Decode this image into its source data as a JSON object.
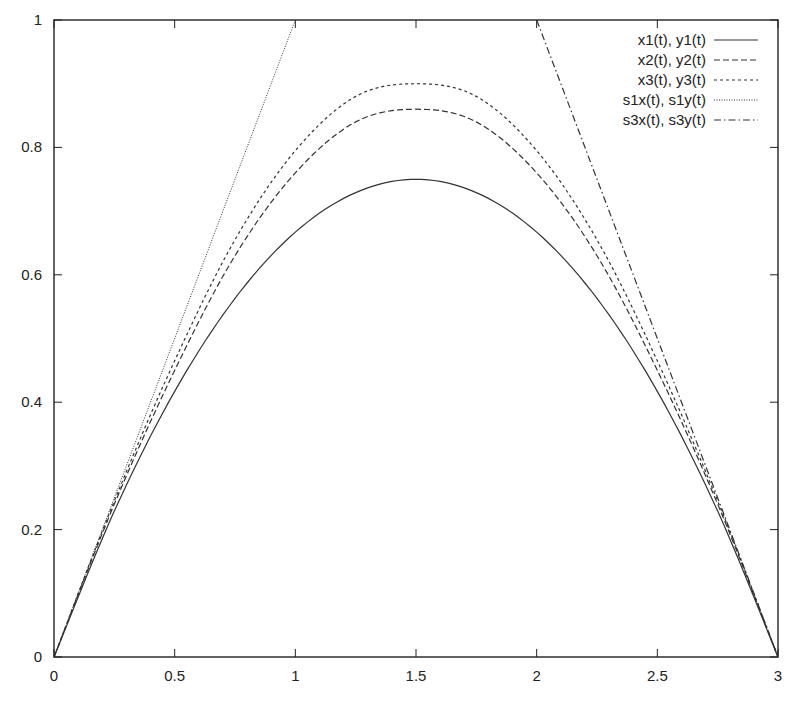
{
  "chart_data": {
    "type": "line",
    "title": "",
    "xlabel": "",
    "ylabel": "",
    "xlim": [
      0,
      3
    ],
    "ylim": [
      0,
      1
    ],
    "grid": false,
    "legend_position": "top-right (inside)",
    "x_ticks": [
      0,
      0.5,
      1,
      1.5,
      2,
      2.5,
      3
    ],
    "x_tick_labels": [
      "0",
      "0.5",
      "1",
      "1.5",
      "2",
      "2.5",
      "3"
    ],
    "y_ticks": [
      0,
      0.2,
      0.4,
      0.6,
      0.8,
      1
    ],
    "y_tick_labels": [
      "0",
      "0.2",
      "0.4",
      "0.6",
      "0.8",
      "1"
    ],
    "series": [
      {
        "name": "x1(t), y1(t)",
        "style": "solid",
        "shape": "parabola-like arch from (0,0) to (3,0)",
        "peak": {
          "x": 1.5,
          "y": 0.75
        },
        "x": [
          0,
          0.25,
          0.5,
          0.75,
          1,
          1.25,
          1.5,
          1.75,
          2,
          2.25,
          2.5,
          2.75,
          3
        ],
        "values": [
          0,
          0.229,
          0.417,
          0.563,
          0.667,
          0.729,
          0.75,
          0.729,
          0.667,
          0.563,
          0.417,
          0.229,
          0
        ]
      },
      {
        "name": "x2(t), y2(t)",
        "style": "dashed",
        "shape": "arch from (0,0) to (3,0)",
        "peak": {
          "x": 1.5,
          "y": 0.86
        },
        "x": [
          0,
          0.25,
          0.5,
          0.75,
          1,
          1.25,
          1.5,
          1.75,
          2,
          2.25,
          2.5,
          2.75,
          3
        ],
        "values": [
          0,
          0.24,
          0.45,
          0.63,
          0.76,
          0.84,
          0.86,
          0.84,
          0.76,
          0.63,
          0.45,
          0.24,
          0
        ]
      },
      {
        "name": "x3(t), y3(t)",
        "style": "dotted (short dash)",
        "shape": "arch from (0,0) to (3,0)",
        "peak": {
          "x": 1.5,
          "y": 0.9
        },
        "x": [
          0,
          0.25,
          0.5,
          0.75,
          1,
          1.25,
          1.5,
          1.75,
          2,
          2.25,
          2.5,
          2.75,
          3
        ],
        "values": [
          0,
          0.245,
          0.465,
          0.655,
          0.795,
          0.88,
          0.9,
          0.88,
          0.795,
          0.655,
          0.465,
          0.245,
          0
        ]
      },
      {
        "name": "s1x(t), s1y(t)",
        "style": "fine dotted",
        "shape": "straight line (tangent at origin)",
        "x": [
          0,
          1
        ],
        "values": [
          0,
          1
        ]
      },
      {
        "name": "s3x(t), s3y(t)",
        "style": "dash-dot",
        "shape": "straight line (tangent at x=3)",
        "x": [
          2,
          3
        ],
        "values": [
          1,
          0
        ]
      }
    ]
  },
  "legend": {
    "items": [
      {
        "label": "x1(t), y1(t)",
        "dash": ""
      },
      {
        "label": "x2(t), y2(t)",
        "dash": "6,3"
      },
      {
        "label": "x3(t), y3(t)",
        "dash": "3,3"
      },
      {
        "label": "s1x(t), s1y(t)",
        "dash": "1,1.5"
      },
      {
        "label": "s3x(t), s3y(t)",
        "dash": "7,3,1.5,3"
      }
    ]
  },
  "colors": {
    "line": "#333333",
    "frame": "#222222",
    "background": "#ffffff"
  }
}
